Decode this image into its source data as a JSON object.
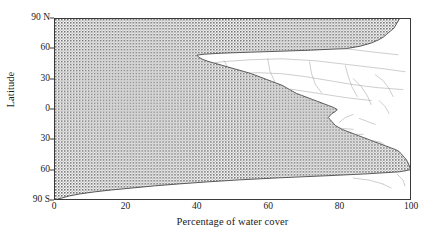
{
  "figure": {
    "background_color": "#ffffff",
    "frame_color": "#3a3a3a",
    "water_fill_color": "#8f8f8f",
    "land_fill_color": "#ffffff",
    "coastline_color": "#9a9a9a"
  },
  "chart_data": {
    "type": "area",
    "title": "",
    "subtitle": "",
    "xlabel": "Percentage of water cover",
    "ylabel": "Latitude",
    "xlim": [
      0,
      100
    ],
    "ylim": [
      -90,
      90
    ],
    "grid": false,
    "legend_position": "none",
    "orientation": "horizontal-area-vs-latitude",
    "xticks": [
      {
        "value": 0,
        "label": "0"
      },
      {
        "value": 20,
        "label": "20"
      },
      {
        "value": 40,
        "label": "40"
      },
      {
        "value": 60,
        "label": "60"
      },
      {
        "value": 80,
        "label": "80"
      },
      {
        "value": 100,
        "label": "100"
      }
    ],
    "yticks": [
      {
        "value": 90,
        "label": "90 N"
      },
      {
        "value": 60,
        "label": "60"
      },
      {
        "value": 30,
        "label": "30"
      },
      {
        "value": 0,
        "label": "0"
      },
      {
        "value": -30,
        "label": "30"
      },
      {
        "value": -60,
        "label": "60"
      },
      {
        "value": -90,
        "label": "90 S"
      }
    ],
    "series": [
      {
        "name": "Percentage of water cover",
        "fill": "stippled-grey",
        "latitude": [
          90,
          87,
          84,
          81,
          78,
          75,
          72,
          69,
          66,
          63,
          60.5,
          60,
          59,
          58,
          57,
          56,
          55,
          54,
          52,
          50,
          48,
          46,
          44,
          42,
          40,
          38,
          36,
          34,
          32,
          30,
          28,
          26,
          24,
          22,
          20,
          18,
          16,
          14,
          12,
          10,
          8,
          6,
          4,
          2,
          0,
          -2,
          -4,
          -6,
          -8,
          -10,
          -12,
          -14,
          -16,
          -18,
          -20,
          -22,
          -24,
          -26,
          -28,
          -30,
          -32,
          -34,
          -36,
          -38,
          -40,
          -42,
          -44,
          -46,
          -48,
          -50,
          -52,
          -54,
          -56,
          -58,
          -60,
          -62,
          -64,
          -66,
          -68,
          -70,
          -72,
          -74,
          -76,
          -78,
          -80,
          -82,
          -84,
          -86,
          -88,
          -90
        ],
        "values": [
          97,
          96.5,
          96,
          95.5,
          94.5,
          93.5,
          92.5,
          91,
          89,
          86,
          82,
          78,
          72,
          64,
          55,
          47,
          42,
          40,
          40.5,
          41.5,
          43,
          45,
          47,
          49,
          51,
          53,
          55,
          56.5,
          58,
          59.5,
          61,
          62.5,
          64,
          65,
          66,
          67,
          68,
          69.5,
          71,
          72.5,
          74,
          75.5,
          77,
          78.5,
          79.5,
          79,
          78,
          77.5,
          77,
          77.5,
          78,
          78.5,
          79,
          80,
          81,
          82.5,
          84,
          85.5,
          87,
          88.5,
          90,
          91.5,
          93,
          94.5,
          96,
          97,
          97.5,
          98,
          98.5,
          99,
          99.3,
          99.6,
          99.8,
          100,
          100,
          97,
          88,
          76,
          63,
          52,
          43,
          35,
          28,
          22,
          16,
          11,
          7,
          4,
          2,
          0
        ]
      }
    ],
    "annotations": [
      {
        "text": "shaded region = water cover",
        "visible": false
      },
      {
        "text": "white region contains faint world coastline / country outlines",
        "visible": true
      }
    ]
  }
}
